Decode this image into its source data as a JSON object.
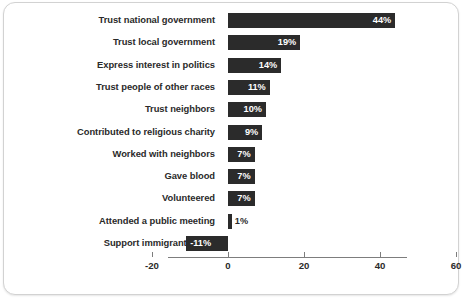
{
  "chart_data": {
    "type": "bar",
    "orientation": "horizontal",
    "title": "",
    "xlabel": "",
    "ylabel": "",
    "xlim": [
      -20,
      60
    ],
    "xticks": [
      -20,
      0,
      20,
      40,
      60
    ],
    "xtick_labels": [
      "-20",
      "0",
      "20",
      "40",
      "60"
    ],
    "grid": false,
    "legend": null,
    "bar_color": "#2b2b2b",
    "value_label_color_inside": "#ffffff",
    "value_label_color_outside": "#2a2a2a",
    "categories": [
      "Trust national government",
      "Trust local government",
      "Express interest in politics",
      "Trust people of other races",
      "Trust neighbors",
      "Contributed to religious charity",
      "Worked with neighbors",
      "Gave blood",
      "Volunteered",
      "Attended a public meeting",
      "Support immigrant rights"
    ],
    "values": [
      44,
      19,
      14,
      11,
      10,
      9,
      7,
      7,
      7,
      1,
      -11
    ],
    "value_labels": [
      "44%",
      "19%",
      "14%",
      "11%",
      "10%",
      "9%",
      "7%",
      "7%",
      "7%",
      "1%",
      "-11%"
    ],
    "label_placement": [
      "inside",
      "inside",
      "inside",
      "inside",
      "inside",
      "inside",
      "inside",
      "inside",
      "inside",
      "outside",
      "inside"
    ]
  },
  "caption": ""
}
